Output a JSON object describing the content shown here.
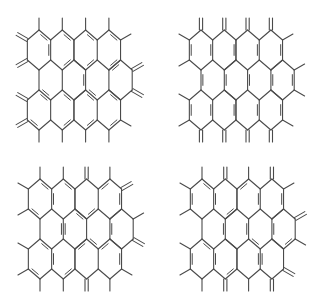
{
  "figure": {
    "line_color": "#4a4a4a",
    "background": "#ffffff"
  },
  "lattice": {
    "hex_half_width": 11.65,
    "hex_half_height": 20,
    "shoulder_offset": 10,
    "rows": [
      {
        "cy": 50,
        "cx": [
          39,
          62.3,
          85.6,
          108.9
        ]
      },
      {
        "cy": 80,
        "cx": [
          50.65,
          73.95,
          97.25,
          120.55
        ]
      },
      {
        "cy": 110,
        "cx": [
          39,
          62.3,
          85.6,
          108.9
        ]
      }
    ],
    "substituent_length": 12
  },
  "structures": [
    {
      "name": "structure-top-left",
      "offset": [
        0,
        0
      ],
      "double_bonds": [
        [
          "r0h0",
          "ur",
          "r0h0",
          "lr"
        ],
        [
          "r0h0",
          "t",
          "r0h0",
          "ur"
        ],
        [
          "r0h1",
          "t",
          "r0h1",
          "ur"
        ],
        [
          "r0h1",
          "lr",
          "r0h1",
          "b"
        ],
        [
          "r0h2",
          "t",
          "r0h2",
          "ur"
        ],
        [
          "r0h2",
          "lr",
          "r0h2",
          "b"
        ],
        [
          "r0h3",
          "t",
          "r0h3",
          "ur"
        ],
        [
          "r0h3",
          "lr",
          "r0h3",
          "b"
        ],
        [
          "r1h0",
          "ll",
          "r1h0",
          "b"
        ],
        [
          "r1h1",
          "ur",
          "r1h1",
          "lr"
        ],
        [
          "r1h2",
          "ll",
          "r1h2",
          "b"
        ],
        [
          "r1h3",
          "t",
          "r1h3",
          "ul"
        ],
        [
          "r2h0",
          "t",
          "r2h0",
          "ur"
        ],
        [
          "r2h0",
          "ll",
          "r2h0",
          "b"
        ],
        [
          "r2h1",
          "t",
          "r2h1",
          "ur"
        ],
        [
          "r2h1",
          "lr",
          "r2h1",
          "b"
        ],
        [
          "r2h2",
          "t",
          "r2h2",
          "ur"
        ],
        [
          "r2h2",
          "lr",
          "r2h2",
          "b"
        ],
        [
          "r2h3",
          "t",
          "r2h3",
          "ur"
        ],
        [
          "r2h3",
          "lr",
          "r2h3",
          "b"
        ]
      ],
      "substituents": [
        {
          "at": [
            "r0h0",
            "t"
          ],
          "dir": "up",
          "double": false
        },
        {
          "at": [
            "r0h1",
            "t"
          ],
          "dir": "up",
          "double": false
        },
        {
          "at": [
            "r0h2",
            "t"
          ],
          "dir": "up",
          "double": false
        },
        {
          "at": [
            "r0h3",
            "t"
          ],
          "dir": "up",
          "double": false
        },
        {
          "at": [
            "r0h3",
            "ur"
          ],
          "dir": "upright",
          "double": false
        },
        {
          "at": [
            "r0h0",
            "ul"
          ],
          "dir": "upleft",
          "double": true
        },
        {
          "at": [
            "r0h0",
            "ll"
          ],
          "dir": "downleft",
          "double": true
        },
        {
          "at": [
            "r1h3",
            "ur"
          ],
          "dir": "upright",
          "double": true
        },
        {
          "at": [
            "r1h3",
            "lr"
          ],
          "dir": "downright",
          "double": true
        },
        {
          "at": [
            "r2h0",
            "ul"
          ],
          "dir": "upleft",
          "double": true
        },
        {
          "at": [
            "r2h0",
            "ll"
          ],
          "dir": "downleft",
          "double": true
        },
        {
          "at": [
            "r2h0",
            "b"
          ],
          "dir": "down",
          "double": false
        },
        {
          "at": [
            "r2h1",
            "b"
          ],
          "dir": "down",
          "double": false
        },
        {
          "at": [
            "r2h2",
            "b"
          ],
          "dir": "down",
          "double": false
        },
        {
          "at": [
            "r2h3",
            "b"
          ],
          "dir": "down",
          "double": false
        },
        {
          "at": [
            "r2h3",
            "lr"
          ],
          "dir": "downright",
          "double": false
        }
      ]
    },
    {
      "name": "structure-top-right",
      "offset": [
        162,
        0
      ],
      "double_bonds": [
        [
          "r0h0",
          "ul",
          "r0h0",
          "ll"
        ],
        [
          "r0h0",
          "ur",
          "r0h0",
          "lr"
        ],
        [
          "r0h1",
          "ur",
          "r0h1",
          "lr"
        ],
        [
          "r0h2",
          "ur",
          "r0h2",
          "lr"
        ],
        [
          "r0h3",
          "ur",
          "r0h3",
          "lr"
        ],
        [
          "r1h0",
          "ul",
          "r1h0",
          "ll"
        ],
        [
          "r1h1",
          "ul",
          "r1h1",
          "ll"
        ],
        [
          "r1h2",
          "ul",
          "r1h2",
          "ll"
        ],
        [
          "r1h3",
          "ul",
          "r1h3",
          "ll"
        ],
        [
          "r1h3",
          "ur",
          "r1h3",
          "lr"
        ],
        [
          "r2h0",
          "ul",
          "r2h0",
          "ll"
        ],
        [
          "r2h0",
          "ur",
          "r2h0",
          "lr"
        ],
        [
          "r2h1",
          "ur",
          "r2h1",
          "lr"
        ],
        [
          "r2h2",
          "ur",
          "r2h2",
          "lr"
        ],
        [
          "r2h3",
          "ur",
          "r2h3",
          "lr"
        ]
      ],
      "substituents": [
        {
          "at": [
            "r0h0",
            "t"
          ],
          "dir": "up",
          "double": true
        },
        {
          "at": [
            "r0h1",
            "t"
          ],
          "dir": "up",
          "double": true
        },
        {
          "at": [
            "r0h2",
            "t"
          ],
          "dir": "up",
          "double": true
        },
        {
          "at": [
            "r0h3",
            "t"
          ],
          "dir": "up",
          "double": true
        },
        {
          "at": [
            "r0h3",
            "ur"
          ],
          "dir": "upright",
          "double": false
        },
        {
          "at": [
            "r0h0",
            "ul"
          ],
          "dir": "upleft",
          "double": false
        },
        {
          "at": [
            "r0h0",
            "ll"
          ],
          "dir": "downleft",
          "double": false
        },
        {
          "at": [
            "r1h3",
            "ur"
          ],
          "dir": "upright",
          "double": false
        },
        {
          "at": [
            "r1h3",
            "lr"
          ],
          "dir": "downright",
          "double": false
        },
        {
          "at": [
            "r2h0",
            "ul"
          ],
          "dir": "upleft",
          "double": false
        },
        {
          "at": [
            "r2h0",
            "ll"
          ],
          "dir": "downleft",
          "double": false
        },
        {
          "at": [
            "r2h0",
            "b"
          ],
          "dir": "down",
          "double": true
        },
        {
          "at": [
            "r2h1",
            "b"
          ],
          "dir": "down",
          "double": true
        },
        {
          "at": [
            "r2h2",
            "b"
          ],
          "dir": "down",
          "double": true
        },
        {
          "at": [
            "r2h3",
            "b"
          ],
          "dir": "down",
          "double": true
        },
        {
          "at": [
            "r2h3",
            "lr"
          ],
          "dir": "downright",
          "double": false
        }
      ]
    },
    {
      "name": "structure-bottom-left",
      "offset": [
        1,
        149
      ],
      "double_bonds": [
        [
          "r0h0",
          "t",
          "r0h0",
          "ur"
        ],
        [
          "r0h0",
          "ll",
          "r0h0",
          "b"
        ],
        [
          "r0h1",
          "ul",
          "r0h1",
          "ll"
        ],
        [
          "r0h1",
          "t",
          "r0h1",
          "ur"
        ],
        [
          "r0h2",
          "lr",
          "r0h2",
          "b"
        ],
        [
          "r0h3",
          "ul",
          "r0h3",
          "t"
        ],
        [
          "r0h3",
          "ur",
          "r0h3",
          "lr"
        ],
        [
          "r1h0",
          "ur",
          "r1h0",
          "lr"
        ],
        [
          "r1h1",
          "ul",
          "r1h1",
          "ll"
        ],
        [
          "r1h1",
          "t",
          "r1h1",
          "ur"
        ],
        [
          "r1h2",
          "ll",
          "r1h2",
          "b"
        ],
        [
          "r1h3",
          "ul",
          "r1h3",
          "ll"
        ],
        [
          "r2h0",
          "t",
          "r2h0",
          "ur"
        ],
        [
          "r2h0",
          "ll",
          "r2h0",
          "b"
        ],
        [
          "r2h1",
          "ul",
          "r2h1",
          "ll"
        ],
        [
          "r2h1",
          "lr",
          "r2h1",
          "b"
        ],
        [
          "r2h2",
          "t",
          "r2h2",
          "ul"
        ],
        [
          "r2h3",
          "ul",
          "r2h3",
          "t"
        ],
        [
          "r2h3",
          "ur",
          "r2h3",
          "lr"
        ]
      ],
      "substituents": [
        {
          "at": [
            "r0h0",
            "t"
          ],
          "dir": "up",
          "double": false
        },
        {
          "at": [
            "r0h1",
            "t"
          ],
          "dir": "up",
          "double": false
        },
        {
          "at": [
            "r0h2",
            "t"
          ],
          "dir": "up",
          "double": true
        },
        {
          "at": [
            "r0h3",
            "t"
          ],
          "dir": "up",
          "double": false
        },
        {
          "at": [
            "r0h3",
            "ur"
          ],
          "dir": "upright",
          "double": true
        },
        {
          "at": [
            "r0h0",
            "ul"
          ],
          "dir": "upleft",
          "double": false
        },
        {
          "at": [
            "r0h0",
            "ll"
          ],
          "dir": "downleft",
          "double": false
        },
        {
          "at": [
            "r1h3",
            "ur"
          ],
          "dir": "upright",
          "double": false
        },
        {
          "at": [
            "r1h3",
            "lr"
          ],
          "dir": "downright",
          "double": true
        },
        {
          "at": [
            "r2h0",
            "ul"
          ],
          "dir": "upleft",
          "double": false
        },
        {
          "at": [
            "r2h0",
            "ll"
          ],
          "dir": "downleft",
          "double": false
        },
        {
          "at": [
            "r2h0",
            "b"
          ],
          "dir": "down",
          "double": false
        },
        {
          "at": [
            "r2h1",
            "b"
          ],
          "dir": "down",
          "double": false
        },
        {
          "at": [
            "r2h2",
            "b"
          ],
          "dir": "down",
          "double": true
        },
        {
          "at": [
            "r2h3",
            "b"
          ],
          "dir": "down",
          "double": false
        },
        {
          "at": [
            "r2h3",
            "lr"
          ],
          "dir": "downright",
          "double": false
        }
      ]
    },
    {
      "name": "structure-bottom-right",
      "offset": [
        163,
        149
      ],
      "double_bonds": [
        [
          "r0h0",
          "t",
          "r0h0",
          "ur"
        ],
        [
          "r0h0",
          "ul",
          "r0h0",
          "ll"
        ],
        [
          "r0h1",
          "lr",
          "r0h1",
          "b"
        ],
        [
          "r0h1",
          "ul",
          "r0h1",
          "ll"
        ],
        [
          "r0h2",
          "t",
          "r0h2",
          "ul"
        ],
        [
          "r0h2",
          "ur",
          "r0h2",
          "lr"
        ],
        [
          "r0h3",
          "ur",
          "r0h3",
          "lr"
        ],
        [
          "r1h0",
          "ur",
          "r1h0",
          "lr"
        ],
        [
          "r1h1",
          "ur",
          "r1h1",
          "lr"
        ],
        [
          "r1h2",
          "ll",
          "r1h2",
          "b"
        ],
        [
          "r1h3",
          "ul",
          "r1h3",
          "ll"
        ],
        [
          "r1h3",
          "lr",
          "r1h3",
          "b"
        ],
        [
          "r2h0",
          "t",
          "r2h0",
          "ur"
        ],
        [
          "r2h0",
          "ul",
          "r2h0",
          "ll"
        ],
        [
          "r2h1",
          "ul",
          "r2h1",
          "ll"
        ],
        [
          "r2h1",
          "lr",
          "r2h1",
          "b"
        ],
        [
          "r2h2",
          "ur",
          "r2h2",
          "lr"
        ],
        [
          "r2h3",
          "ul",
          "r2h3",
          "ll"
        ]
      ],
      "substituents": [
        {
          "at": [
            "r0h0",
            "t"
          ],
          "dir": "up",
          "double": false
        },
        {
          "at": [
            "r0h1",
            "t"
          ],
          "dir": "up",
          "double": true
        },
        {
          "at": [
            "r0h2",
            "t"
          ],
          "dir": "up",
          "double": false
        },
        {
          "at": [
            "r0h3",
            "t"
          ],
          "dir": "up",
          "double": true
        },
        {
          "at": [
            "r0h3",
            "ur"
          ],
          "dir": "upright",
          "double": false
        },
        {
          "at": [
            "r0h0",
            "ul"
          ],
          "dir": "upleft",
          "double": false
        },
        {
          "at": [
            "r0h0",
            "ll"
          ],
          "dir": "downleft",
          "double": false
        },
        {
          "at": [
            "r1h3",
            "ur"
          ],
          "dir": "upright",
          "double": true
        },
        {
          "at": [
            "r1h3",
            "lr"
          ],
          "dir": "downright",
          "double": false
        },
        {
          "at": [
            "r2h0",
            "ul"
          ],
          "dir": "upleft",
          "double": false
        },
        {
          "at": [
            "r2h0",
            "ll"
          ],
          "dir": "downleft",
          "double": false
        },
        {
          "at": [
            "r2h0",
            "b"
          ],
          "dir": "down",
          "double": false
        },
        {
          "at": [
            "r2h1",
            "b"
          ],
          "dir": "down",
          "double": true
        },
        {
          "at": [
            "r2h2",
            "b"
          ],
          "dir": "down",
          "double": false
        },
        {
          "at": [
            "r2h3",
            "b"
          ],
          "dir": "down",
          "double": true
        },
        {
          "at": [
            "r2h3",
            "lr"
          ],
          "dir": "downright",
          "double": true
        }
      ]
    }
  ]
}
